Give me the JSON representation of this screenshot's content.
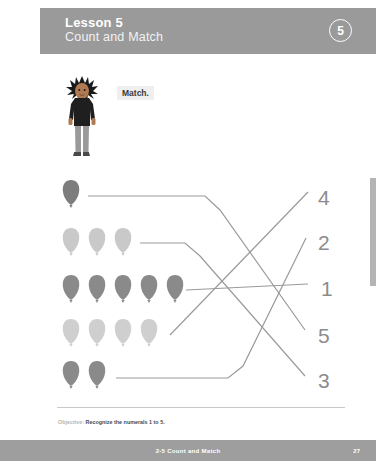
{
  "header": {
    "title": "Lesson 5",
    "subtitle": "Count and Match",
    "badge": "5"
  },
  "character": {
    "name": "boy-character",
    "speech_label": "Match.",
    "hair_color": "#1a1a1a",
    "skin_color": "#b07a52",
    "shirt_color": "#1f1f1f",
    "pants_color": "#9a9a9a",
    "shoe_color": "#4a4a4a"
  },
  "activity": {
    "rows": [
      {
        "id": "row-1",
        "count": 1,
        "balloon_color": "#7d7d7d",
        "y": 194
      },
      {
        "id": "row-2",
        "count": 3,
        "balloon_color": "#c9c9c9",
        "y": 242
      },
      {
        "id": "row-3",
        "count": 5,
        "balloon_color": "#8a8a8a",
        "y": 289
      },
      {
        "id": "row-4",
        "count": 4,
        "balloon_color": "#cfcfcf",
        "y": 333
      },
      {
        "id": "row-5",
        "count": 2,
        "balloon_color": "#8a8a8a",
        "y": 375
      }
    ],
    "numerals": [
      {
        "id": "numeral-4",
        "label": "4",
        "x": 318,
        "y": 186
      },
      {
        "id": "numeral-2",
        "label": "2",
        "x": 318,
        "y": 231
      },
      {
        "id": "numeral-1",
        "label": "1",
        "x": 321,
        "y": 277
      },
      {
        "id": "numeral-5",
        "label": "5",
        "x": 318,
        "y": 324
      },
      {
        "id": "numeral-3",
        "label": "3",
        "x": 318,
        "y": 369
      }
    ],
    "connectors": [
      {
        "id": "connector-row1-to-5",
        "from_row": 1,
        "to_numeral": "5",
        "points": "88,196 205,196 220,210 305,330"
      },
      {
        "id": "connector-row2-to-3",
        "from_row": 2,
        "to_numeral": "3",
        "points": "140,243 185,243 200,256 305,376"
      },
      {
        "id": "connector-row3-to-1",
        "from_row": 3,
        "to_numeral": "1",
        "points": "186,290 308,284"
      },
      {
        "id": "connector-row4-to-4",
        "from_row": 4,
        "to_numeral": "4",
        "points": "170,335 308,192"
      },
      {
        "id": "connector-row5-to-2",
        "from_row": 5,
        "to_numeral": "2",
        "points": "116,378 228,378 243,366 306,238"
      }
    ],
    "line_color": "#9a9a9a"
  },
  "objective": {
    "label": "Objective:",
    "text": "Recognize the numerals 1 to 5."
  },
  "footer": {
    "center": "2-5 Count and Match",
    "page": "27"
  }
}
